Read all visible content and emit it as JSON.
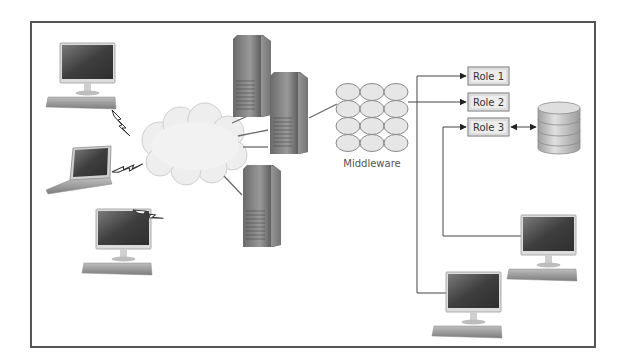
{
  "diagram": {
    "middleware": {
      "label": "Middleware",
      "grid": {
        "rows": 4,
        "cols": 3
      }
    },
    "roles": [
      {
        "label": "Role 1"
      },
      {
        "label": "Role 2"
      },
      {
        "label": "Role 3"
      }
    ],
    "nodes": {
      "left_clients": [
        "desktop-workstation",
        "laptop",
        "desktop-workstation"
      ],
      "network": "cloud",
      "servers": [
        "tower-server",
        "tower-server",
        "tower-server"
      ],
      "database": "database-cylinder",
      "right_clients": [
        "desktop-workstation",
        "desktop-workstation"
      ]
    },
    "connections": {
      "clients_to_cloud": "wireless-lightning",
      "cloud_to_servers": "wired",
      "server_to_middleware": "wired",
      "middleware_to_roles": "arrow",
      "role3_to_database": "bidirectional-arrow"
    },
    "colors": {
      "frame": "#555555",
      "line": "#666666",
      "screen": "#4a4a4a",
      "cloud": "#eeeeee",
      "role_box_fill": "#eeeeee",
      "middleware_cell": "#e4e4e4"
    }
  }
}
